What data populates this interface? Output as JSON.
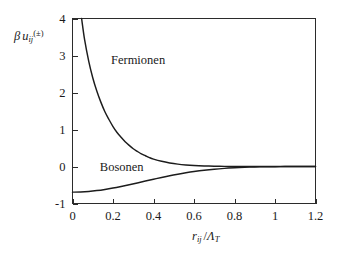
{
  "figure": {
    "background_color": "#ffffff",
    "curve_color": "#1c1c1c",
    "axis_color": "#2b2b2b"
  },
  "axes": {
    "ylabel_parts": {
      "beta": "β",
      "u": "u",
      "u_sub": "ij",
      "u_sup": "(±)"
    },
    "xlabel_parts": {
      "r": "r",
      "r_sub": "ij",
      "slash": "/",
      "lambda": "Λ",
      "lambda_sub": "T"
    },
    "ylabel_text": "β u_ij^(±)",
    "xlabel_text": "r_ij /Λ_T"
  },
  "chart_data": {
    "type": "line",
    "title": "",
    "subtitle": "",
    "xlabel": "r_ij /Λ_T",
    "ylabel": "β u_ij^(±)",
    "xlim": [
      0,
      1.2
    ],
    "ylim": [
      -1,
      4
    ],
    "xticks": [
      0,
      0.2,
      0.4,
      0.6,
      0.8,
      1,
      1.2
    ],
    "xticklabels": [
      "0",
      "0.2",
      "0.4",
      "0.6",
      "0.8",
      "1",
      "1.2"
    ],
    "yticks": [
      -1,
      0,
      1,
      2,
      3,
      4
    ],
    "yticklabels": [
      "-1",
      "0",
      "1",
      "2",
      "3",
      "4"
    ],
    "grid": false,
    "legend": "inline-annotations",
    "annotations": [
      {
        "text": "Fermionen",
        "x": 0.19,
        "y": 2.78
      },
      {
        "text": "Bosonen",
        "x": 0.135,
        "y": -0.12
      }
    ],
    "series": [
      {
        "name": "Fermionen",
        "formula": "-ln(1 - exp(-2*pi*x^2))",
        "color": "#1c1c1c",
        "x": [
          0.045,
          0.06,
          0.08,
          0.1,
          0.12,
          0.14,
          0.16,
          0.18,
          0.2,
          0.22,
          0.24,
          0.26,
          0.28,
          0.3,
          0.32,
          0.34,
          0.36,
          0.38,
          0.4,
          0.44,
          0.48,
          0.52,
          0.56,
          0.6,
          0.65,
          0.7,
          0.75,
          0.8,
          0.85,
          0.9,
          0.95,
          1.0,
          1.05,
          1.1,
          1.15,
          1.2
        ],
        "y": [
          4.0,
          3.42,
          2.85,
          2.4,
          2.04,
          1.74,
          1.48,
          1.27,
          1.08,
          0.92,
          0.79,
          0.67,
          0.57,
          0.48,
          0.41,
          0.34,
          0.29,
          0.24,
          0.2,
          0.14,
          0.096,
          0.064,
          0.042,
          0.027,
          0.015,
          0.0077,
          0.0038,
          0.0018,
          0.00082,
          0.00036,
          0.00015,
          6e-05,
          2e-05,
          1e-05,
          3e-06,
          1e-06
        ]
      },
      {
        "name": "Bosonen",
        "formula": "-ln(1 + exp(-2*pi*x^2))",
        "color": "#1c1c1c",
        "x": [
          0.0,
          0.04,
          0.08,
          0.12,
          0.16,
          0.2,
          0.24,
          0.28,
          0.32,
          0.36,
          0.4,
          0.44,
          0.48,
          0.52,
          0.56,
          0.6,
          0.65,
          0.7,
          0.75,
          0.8,
          0.85,
          0.9,
          0.95,
          1.0,
          1.05,
          1.1,
          1.15,
          1.2
        ],
        "y": [
          -0.693,
          -0.688,
          -0.674,
          -0.651,
          -0.62,
          -0.583,
          -0.54,
          -0.493,
          -0.444,
          -0.394,
          -0.345,
          -0.297,
          -0.251,
          -0.209,
          -0.171,
          -0.137,
          -0.101,
          -0.072,
          -0.05,
          -0.033,
          -0.021,
          -0.013,
          -0.0076,
          -0.0043,
          -0.0023,
          -0.0012,
          -0.0006,
          -0.0003
        ]
      }
    ]
  }
}
